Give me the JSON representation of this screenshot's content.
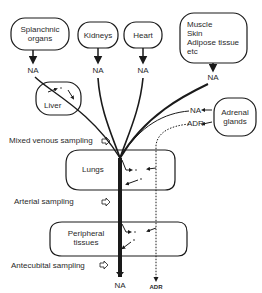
{
  "organs": {
    "splanchnic": "Splanchnic organs",
    "splanchnic_line1": "Splanchnic",
    "splanchnic_line2": "organs",
    "kidneys": "Kidneys",
    "heart": "Heart",
    "muscle_line1": "Muscle",
    "muscle_line2": "Skin",
    "muscle_line3": "Adipose tissue",
    "muscle_line4": "etc",
    "liver": "Liver",
    "adrenal_line1": "Adrenal",
    "adrenal_line2": "glands",
    "lungs": "Lungs",
    "peripheral_line1": "Peripheral",
    "peripheral_line2": "tissues"
  },
  "labels": {
    "na": "NA",
    "adr": "ADR"
  },
  "sampling": {
    "mixed_venous": "Mixed venous sampling",
    "arterial": "Arterial sampling",
    "antecubital": "Antecubital sampling"
  },
  "colors": {
    "stroke": "#1a1a1a",
    "text": "#2a2a2a",
    "background": "#ffffff"
  }
}
